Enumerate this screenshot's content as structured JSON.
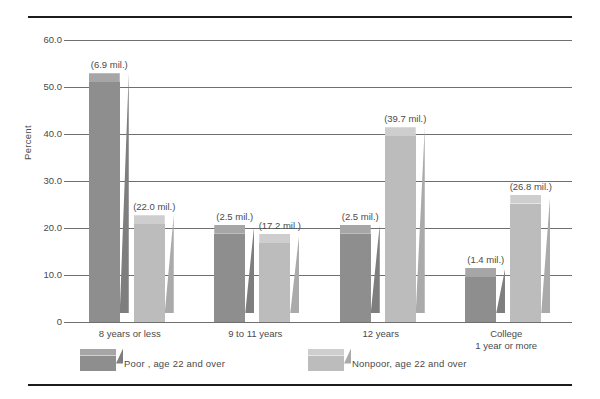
{
  "chart_data": {
    "type": "bar",
    "title": "",
    "subtitle": "",
    "xlabel": "",
    "ylabel": "Percent",
    "ylim": [
      0,
      60
    ],
    "ytick_labels": [
      "0",
      "10.0",
      "20.0",
      "30.0",
      "40.0",
      "50.0",
      "60.0"
    ],
    "ytick_values": [
      0,
      10,
      20,
      30,
      40,
      50,
      60
    ],
    "grid": true,
    "legend_position": "bottom",
    "categories": [
      "8 years or less",
      "9 to 11 years",
      "12 years",
      "College\n1 year  or more"
    ],
    "category_lines": [
      {
        "line1": "8 years or less",
        "line2": ""
      },
      {
        "line1": "9 to 11 years",
        "line2": ""
      },
      {
        "line1": "12  years",
        "line2": ""
      },
      {
        "line1": "College",
        "line2": "1 year  or more"
      }
    ],
    "series": [
      {
        "name": "Poor , age 22 and over",
        "color": "#8e8e8e",
        "values": [
          51.0,
          18.8,
          18.8,
          9.6
        ],
        "labels": [
          "(6.9 mil.)",
          "(2.5 mil.)",
          "(2.5 mil.)",
          "(1.4 mil.)"
        ]
      },
      {
        "name": "Nonpoor, age 22 and over",
        "color": "#bcbcbc",
        "values": [
          20.8,
          16.8,
          39.5,
          25.2
        ],
        "labels": [
          "(22.0 mil.)",
          "(17.2 mil.)",
          "(39.7 mil.)",
          "(26.8 mil.)"
        ]
      }
    ]
  },
  "legend": {
    "items": [
      {
        "label": "Poor , age 22 and over",
        "swatch": "dark"
      },
      {
        "label": "Nonpoor, age 22 and over",
        "swatch": "light"
      }
    ]
  },
  "axis": {
    "y_title": "Percent"
  },
  "colors": {
    "poor_bar": "#8e8e8e",
    "nonpoor_bar": "#bcbcbc",
    "gridline": "#6f6f6f",
    "rule": "#1c1c1c",
    "text": "#4a4a4a",
    "background": "#ffffff"
  }
}
